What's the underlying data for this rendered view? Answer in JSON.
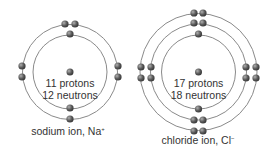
{
  "atoms": [
    {
      "name": "sodium",
      "center": [
        70,
        72
      ],
      "shells": [
        37,
        47.5
      ],
      "nucleus_lines": [
        "11 protons",
        "12 neutrons"
      ],
      "label": "sodium ion, Na",
      "charge": "+",
      "electrons": [
        [
          65,
          24
        ],
        [
          75,
          24
        ],
        [
          70,
          34
        ],
        [
          22,
          66
        ],
        [
          22,
          77
        ],
        [
          118,
          66
        ],
        [
          118,
          77
        ],
        [
          70,
          108
        ],
        [
          70,
          119
        ]
      ]
    },
    {
      "name": "chloride",
      "center": [
        198.5,
        72
      ],
      "shells": [
        37,
        48,
        58.5
      ],
      "nucleus_lines": [
        "17 protons",
        "18 neutrons"
      ],
      "label": "chloride ion, Cl",
      "charge": "−",
      "electrons": [
        [
          194,
          13
        ],
        [
          203,
          13
        ],
        [
          194,
          23
        ],
        [
          203,
          23
        ],
        [
          198.5,
          34
        ],
        [
          141,
          67
        ],
        [
          141,
          78
        ],
        [
          151,
          67
        ],
        [
          151,
          78
        ],
        [
          246,
          67
        ],
        [
          246,
          78
        ],
        [
          256,
          67
        ],
        [
          256,
          78
        ],
        [
          198.5,
          109
        ],
        [
          194,
          120
        ],
        [
          203,
          120
        ],
        [
          194,
          131
        ],
        [
          203,
          131
        ]
      ]
    }
  ],
  "colors": {
    "shell": "#8a8a8a",
    "electron": "#555555",
    "text": "#333333"
  }
}
